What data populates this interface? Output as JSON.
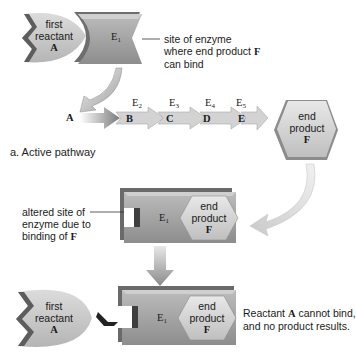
{
  "diagram": {
    "top": {
      "reactant": {
        "line1": "first",
        "line2": "reactant",
        "letter": "A"
      },
      "enzyme": {
        "letter": "E",
        "sub": "1"
      },
      "annotation": {
        "line1": "site of enzyme",
        "line2": "where end product",
        "letter": "F",
        "line3": "can bind"
      }
    },
    "pathway": {
      "start": "A",
      "steps": [
        {
          "enzyme": "E",
          "sub": "2",
          "product": "B"
        },
        {
          "enzyme": "E",
          "sub": "3",
          "product": "C"
        },
        {
          "enzyme": "E",
          "sub": "4",
          "product": "D"
        },
        {
          "enzyme": "E",
          "sub": "5",
          "product": "E"
        }
      ],
      "end_product": {
        "line1": "end",
        "line2": "product",
        "letter": "F"
      }
    },
    "caption": "a. Active pathway",
    "middle": {
      "annotation": {
        "line1": "altered site of",
        "line2": "enzyme due to",
        "line3": "binding of",
        "letter": "F"
      },
      "enzyme": {
        "letter": "E",
        "sub": "1"
      },
      "end_product": {
        "line1": "end",
        "line2": "product",
        "letter": "F"
      }
    },
    "bottom": {
      "reactant": {
        "line1": "first",
        "line2": "reactant",
        "letter": "A"
      },
      "enzyme": {
        "letter": "E",
        "sub": "1"
      },
      "end_product": {
        "line1": "end",
        "line2": "product",
        "letter": "F"
      },
      "result": {
        "line1a": "Reactant ",
        "letter": "A",
        "line1b": " cannot bind,",
        "line2": "and no product results."
      }
    },
    "colors": {
      "reactant_fill": "#c9c9c9",
      "enzyme_fill": "#a9a9a9",
      "enzyme_dark": "#5a5a5a",
      "product_fill": "#d8d8d8",
      "arrow_fill": "#bdbdbd",
      "arrow_light": "#e6e6e6"
    }
  }
}
